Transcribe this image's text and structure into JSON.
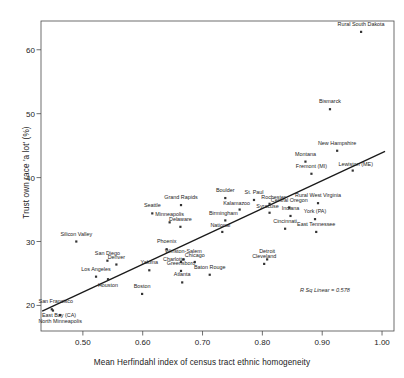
{
  "chart_data": {
    "type": "scatter",
    "title": "",
    "xlabel": "Mean Herfindahl index of census tract ethnic homogeneity",
    "ylabel": "Trust own race 'a lot' (%)",
    "xlim": [
      0.43,
      1.02
    ],
    "ylim": [
      16.0,
      64.5
    ],
    "xticks": [
      "0.50",
      "0.60",
      "0.70",
      "0.80",
      "0.90",
      "1.00"
    ],
    "xtick_values": [
      0.5,
      0.6,
      0.7,
      0.8,
      0.9,
      1.0
    ],
    "yticks": [
      "20",
      "30",
      "40",
      "50",
      "60"
    ],
    "ytick_values": [
      20,
      30,
      40,
      50,
      60
    ],
    "grid": false,
    "legend": false,
    "annotation": "R Sq Linear = 0.578",
    "fit_line": {
      "type": "linear",
      "x_start": 0.432,
      "y_start": 19.1,
      "x_end": 1.005,
      "y_end": 44.1
    },
    "marker_color": "#333333",
    "line_color": "#1a1a1a",
    "points": [
      {
        "label": "Rural South Dakota",
        "x": 0.965,
        "y": 62.8,
        "lpos": "c",
        "ldx": 0,
        "ldy": -7
      },
      {
        "label": "Bismarck",
        "x": 0.913,
        "y": 50.7,
        "lpos": "c",
        "ldx": 0,
        "ldy": -7
      },
      {
        "label": "New Hampshire",
        "x": 0.925,
        "y": 44.2,
        "lpos": "c",
        "ldx": 0,
        "ldy": -7
      },
      {
        "label": "Montana",
        "x": 0.872,
        "y": 42.5,
        "lpos": "c",
        "ldx": 0,
        "ldy": -7
      },
      {
        "label": "Lewiston (ME)",
        "x": 0.951,
        "y": 41.1,
        "lpos": "c",
        "ldx": 3,
        "ldy": -6
      },
      {
        "label": "Fremont (MI)",
        "x": 0.882,
        "y": 40.6,
        "lpos": "c",
        "ldx": 0,
        "ldy": -7
      },
      {
        "label": "Rural West Virginia",
        "x": 0.893,
        "y": 36.0,
        "lpos": "c",
        "ldx": 0,
        "ldy": -7
      },
      {
        "label": "Boulder",
        "x": 0.738,
        "y": 36.8,
        "lpos": "c",
        "ldx": 0,
        "ldy": -7
      },
      {
        "label": "St. Paul",
        "x": 0.786,
        "y": 36.5,
        "lpos": "c",
        "ldx": 0,
        "ldy": -7
      },
      {
        "label": "Grand Rapids",
        "x": 0.664,
        "y": 35.7,
        "lpos": "c",
        "ldx": 0,
        "ldy": -7
      },
      {
        "label": "Rochester",
        "x": 0.812,
        "y": 35.9,
        "lpos": "c",
        "ldx": 4,
        "ldy": -6
      },
      {
        "label": "Central Oregon",
        "x": 0.845,
        "y": 35.3,
        "lpos": "c",
        "ldx": 0,
        "ldy": -7
      },
      {
        "label": "Syracuse",
        "x": 0.812,
        "y": 34.5,
        "lpos": "c",
        "ldx": -2,
        "ldy": -6
      },
      {
        "label": "Kalamazoo",
        "x": 0.762,
        "y": 35.0,
        "lpos": "c",
        "ldx": -3,
        "ldy": -6
      },
      {
        "label": "Seattle",
        "x": 0.616,
        "y": 34.4,
        "lpos": "c",
        "ldx": 0,
        "ldy": -7
      },
      {
        "label": "Indiana",
        "x": 0.847,
        "y": 34.0,
        "lpos": "c",
        "ldx": 0,
        "ldy": -7
      },
      {
        "label": "York (PA)",
        "x": 0.888,
        "y": 33.5,
        "lpos": "c",
        "ldx": 0,
        "ldy": -7
      },
      {
        "label": "Minneapolis",
        "x": 0.645,
        "y": 33.0,
        "lpos": "c",
        "ldx": 0,
        "ldy": -7
      },
      {
        "label": "Birmingham",
        "x": 0.738,
        "y": 33.3,
        "lpos": "c",
        "ldx": -2,
        "ldy": -6
      },
      {
        "label": "Delaware",
        "x": 0.663,
        "y": 32.3,
        "lpos": "c",
        "ldx": 0,
        "ldy": -7
      },
      {
        "label": "Cincinnati",
        "x": 0.838,
        "y": 32.0,
        "lpos": "c",
        "ldx": 0,
        "ldy": -7
      },
      {
        "label": "East Tennessee",
        "x": 0.89,
        "y": 31.5,
        "lpos": "c",
        "ldx": 0,
        "ldy": -7
      },
      {
        "label": "National",
        "x": 0.733,
        "y": 31.5,
        "lpos": "c",
        "ldx": -2,
        "ldy": -6
      },
      {
        "label": "Silicon Valley",
        "x": 0.489,
        "y": 30.0,
        "lpos": "c",
        "ldx": 0,
        "ldy": -7
      },
      {
        "label": "Phoenix",
        "x": 0.64,
        "y": 28.8,
        "lpos": "c",
        "ldx": 0,
        "ldy": -7
      },
      {
        "label": "Winston-Salem",
        "x": 0.668,
        "y": 27.2,
        "lpos": "c",
        "ldx": 0,
        "ldy": -7
      },
      {
        "label": "Detroit",
        "x": 0.808,
        "y": 27.2,
        "lpos": "c",
        "ldx": 0,
        "ldy": -7
      },
      {
        "label": "San Diego",
        "x": 0.541,
        "y": 27.0,
        "lpos": "c",
        "ldx": 0,
        "ldy": -7
      },
      {
        "label": "Charlotte",
        "x": 0.664,
        "y": 26.8,
        "lpos": "c",
        "ldx": -7,
        "ldy": -2
      },
      {
        "label": "Chicago",
        "x": 0.687,
        "y": 26.8,
        "lpos": "c",
        "ldx": 0,
        "ldy": -6
      },
      {
        "label": "Cleveland",
        "x": 0.803,
        "y": 26.5,
        "lpos": "c",
        "ldx": 0,
        "ldy": -7
      },
      {
        "label": "Denver",
        "x": 0.556,
        "y": 26.4,
        "lpos": "c",
        "ldx": 0,
        "ldy": -7
      },
      {
        "label": "Yakima",
        "x": 0.611,
        "y": 25.5,
        "lpos": "c",
        "ldx": 0,
        "ldy": -7
      },
      {
        "label": "Greensboro",
        "x": 0.664,
        "y": 25.4,
        "lpos": "c",
        "ldx": 0,
        "ldy": -7
      },
      {
        "label": "Baton Rouge",
        "x": 0.712,
        "y": 24.8,
        "lpos": "c",
        "ldx": 0,
        "ldy": -7
      },
      {
        "label": "Los Angeles",
        "x": 0.522,
        "y": 24.5,
        "lpos": "c",
        "ldx": 0,
        "ldy": -7
      },
      {
        "label": "Atlanta",
        "x": 0.666,
        "y": 23.6,
        "lpos": "c",
        "ldx": 0,
        "ldy": -7
      },
      {
        "label": "Houston",
        "x": 0.542,
        "y": 24.1,
        "lpos": "c",
        "ldx": 0,
        "ldy": 7
      },
      {
        "label": "Boston",
        "x": 0.599,
        "y": 21.8,
        "lpos": "c",
        "ldx": 0,
        "ldy": -7
      },
      {
        "label": "San Francisco",
        "x": 0.448,
        "y": 19.4,
        "lpos": "c",
        "ldx": 4,
        "ldy": -7
      },
      {
        "label": "East Bay (CA)",
        "x": 0.45,
        "y": 19.2,
        "lpos": "c",
        "ldx": 6,
        "ldy": 5
      },
      {
        "label": "North Minneapolis",
        "x": 0.462,
        "y": 18.5,
        "lpos": "c",
        "ldx": 0,
        "ldy": 7
      }
    ]
  }
}
